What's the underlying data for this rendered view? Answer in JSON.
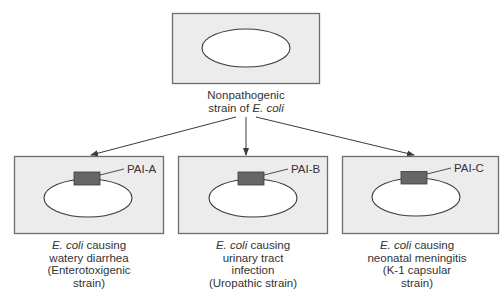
{
  "diagram": {
    "colors": {
      "box_fill": "#ececec",
      "box_stroke": "#6e6e6e",
      "ellipse_fill": "#ffffff",
      "ellipse_stroke": "#3a3a3a",
      "pai_fill": "#666666",
      "arrow": "#3a3a3a"
    },
    "source": {
      "label_line1": "Nonpathogenic",
      "label_line2_prefix": "strain of ",
      "label_line2_italic": "E. coli"
    },
    "strains": [
      {
        "pai_label": "PAI-A",
        "caption_italic": "E. coli",
        "caption_line1_rest": " causing",
        "caption_line2": "watery diarrhea",
        "caption_line3": "(Enterotoxigenic",
        "caption_line4": "strain)"
      },
      {
        "pai_label": "PAI-B",
        "caption_italic": "E. coli",
        "caption_line1_rest": " causing",
        "caption_line2": "urinary tract",
        "caption_line3": "infection",
        "caption_line4": "(Uropathic strain)"
      },
      {
        "pai_label": "PAI-C",
        "caption_italic": "E. coli",
        "caption_line1_rest": " causing",
        "caption_line2": "neonatal meningitis",
        "caption_line3": "(K-1 capsular",
        "caption_line4": "strain)"
      }
    ]
  }
}
